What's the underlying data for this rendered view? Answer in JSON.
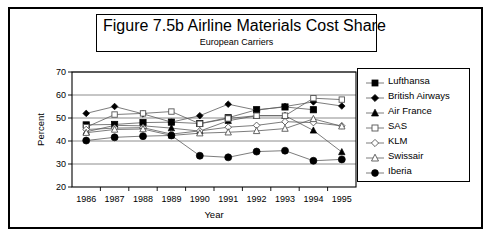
{
  "figure": {
    "title_main": "Figure 7.5b  Airline Materials Cost Share",
    "title_sub": "European Carriers"
  },
  "legend": {
    "items": [
      {
        "label": "Lufthansa",
        "marker": "filled-square-icon"
      },
      {
        "label": "British Airways",
        "marker": "filled-diamond-icon"
      },
      {
        "label": "Air France",
        "marker": "filled-triangle-icon"
      },
      {
        "label": "SAS",
        "marker": "open-square-icon"
      },
      {
        "label": "KLM",
        "marker": "open-diamond-icon"
      },
      {
        "label": "Swissair",
        "marker": "open-triangle-icon"
      },
      {
        "label": "Iberia",
        "marker": "filled-circle-icon"
      }
    ]
  },
  "axes": {
    "y_ticks": [
      "70",
      "60",
      "50",
      "40",
      "30",
      "20"
    ],
    "x_ticks": [
      "1986",
      "1987",
      "1988",
      "1989",
      "1990",
      "1991",
      "1992",
      "1993",
      "1994",
      "1995"
    ],
    "ylabel": "Percent",
    "xlabel": "Year"
  },
  "chart_data": {
    "type": "line",
    "title": "Figure 7.5b  Airline Materials Cost Share",
    "subtitle": "European Carriers",
    "xlabel": "Year",
    "ylabel": "Percent",
    "ylim": [
      20,
      70
    ],
    "ytick_step": 10,
    "grid": true,
    "legend_position": "right",
    "categories": [
      "1986",
      "1987",
      "1988",
      "1989",
      "1990",
      "1991",
      "1992",
      "1993",
      "1994",
      "1995"
    ],
    "series": [
      {
        "name": "Lufthansa",
        "marker": "filled-square",
        "values": [
          47.0,
          47.2,
          48.0,
          48.2,
          47.6,
          50.1,
          53.6,
          54.8,
          53.6,
          null
        ]
      },
      {
        "name": "British Airways",
        "marker": "filled-diamond",
        "values": [
          52.0,
          55.0,
          51.8,
          48.2,
          51.0,
          56.0,
          53.4,
          55.0,
          57.0,
          55.2
        ]
      },
      {
        "name": "Air France",
        "marker": "filled-triangle",
        "values": [
          44.0,
          46.8,
          46.6,
          45.6,
          44.3,
          48.8,
          51.0,
          51.0,
          44.6,
          35.2
        ]
      },
      {
        "name": "SAS",
        "marker": "open-square",
        "values": [
          46.0,
          51.5,
          52.0,
          52.8,
          47.5,
          49.8,
          51.0,
          51.0,
          58.6,
          58.0
        ]
      },
      {
        "name": "KLM",
        "marker": "open-diamond",
        "values": [
          45.0,
          45.6,
          45.8,
          43.0,
          44.4,
          46.0,
          46.8,
          48.4,
          48.0,
          46.6
        ]
      },
      {
        "name": "Swissair",
        "marker": "open-triangle",
        "values": [
          43.6,
          45.0,
          45.2,
          42.4,
          43.4,
          43.8,
          44.4,
          45.4,
          49.6,
          46.4
        ]
      },
      {
        "name": "Iberia",
        "marker": "filled-circle",
        "values": [
          40.2,
          41.6,
          42.1,
          42.4,
          33.6,
          32.9,
          35.4,
          35.8,
          31.4,
          32.0
        ]
      }
    ]
  }
}
